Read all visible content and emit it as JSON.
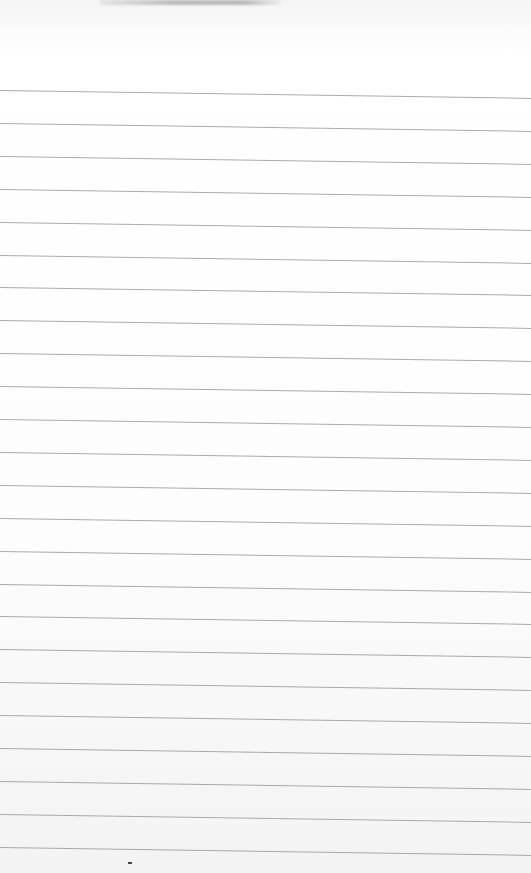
{
  "scene": {
    "description": "Blank sheet of ruled notebook paper",
    "paper_color": "#fbfbfb",
    "rule_color": "#8f8f8f",
    "rule_count": 24,
    "rule_start_y": 90,
    "rule_spacing": 32.9,
    "rules_text": []
  }
}
